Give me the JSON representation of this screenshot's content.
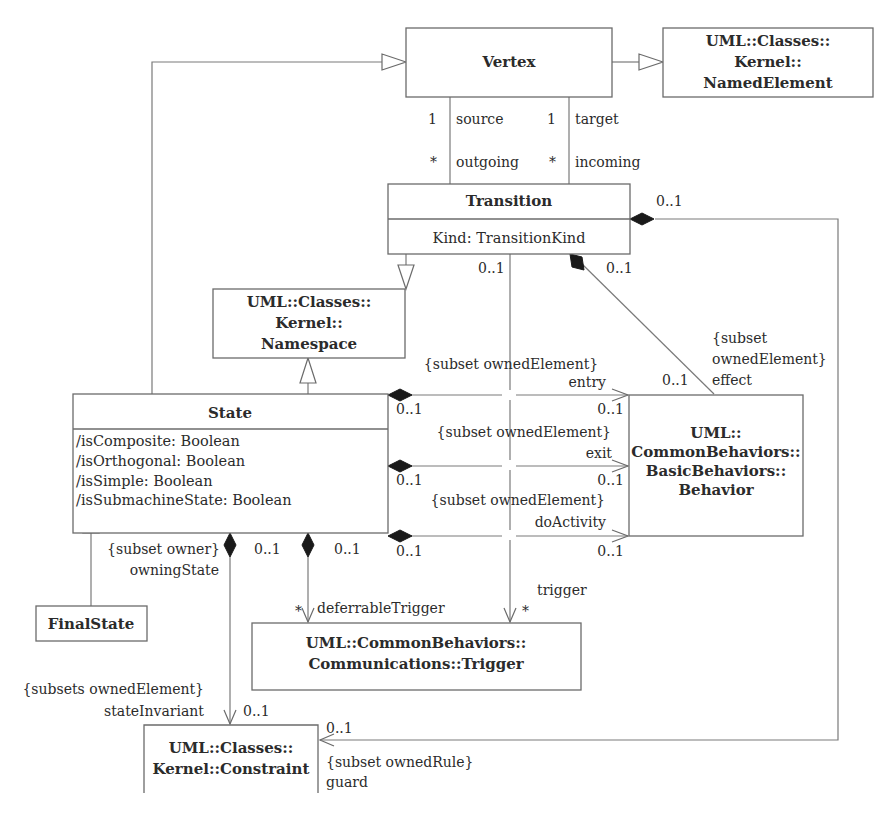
{
  "diagram": {
    "type": "UML class diagram",
    "classes": {
      "vertex": {
        "name": "Vertex"
      },
      "named_element": {
        "lines": [
          "UML::Classes::",
          "Kernel::",
          "NamedElement"
        ]
      },
      "transition": {
        "name": "Transition",
        "attributes": [
          "Kind: TransitionKind"
        ]
      },
      "namespace": {
        "lines": [
          "UML::Classes::",
          "Kernel::",
          "Namespace"
        ]
      },
      "state": {
        "name": "State",
        "attributes": [
          "/isComposite: Boolean",
          "/isOrthogonal: Boolean",
          "/isSimple: Boolean",
          "/isSubmachineState: Boolean"
        ]
      },
      "behavior": {
        "lines": [
          "UML::",
          "CommonBehaviors::",
          "BasicBehaviors::",
          "Behavior"
        ]
      },
      "final_state": {
        "name": "FinalState"
      },
      "trigger": {
        "lines": [
          "UML::CommonBehaviors::",
          "Communications::Trigger"
        ]
      },
      "constraint": {
        "lines": [
          "UML::Classes::",
          "Kernel::Constraint"
        ]
      }
    },
    "associations": {
      "source": {
        "mult_vertex": "1",
        "role_vertex": "source",
        "mult_transition": "*",
        "role_transition": "outgoing"
      },
      "target": {
        "mult_vertex": "1",
        "role_vertex": "target",
        "mult_transition": "*",
        "role_transition": "incoming"
      },
      "guard": {
        "mult_owner": "0..1",
        "mult_end": "0..1",
        "constraint": "{subset ownedRule}",
        "role": "guard"
      },
      "trigger": {
        "mult_owner": "0..1",
        "constraint": "{subset ownedElement}",
        "role": "trigger",
        "mult_end": "*"
      },
      "effect": {
        "mult_owner": "0..1",
        "constraint_line1": "{subset",
        "constraint_line2": "ownedElement}",
        "role": "effect",
        "mult_end": "0..1"
      },
      "entry": {
        "mult_owner": "0..1",
        "role": "entry",
        "mult_end": "0..1"
      },
      "exit": {
        "constraint": "{subset ownedElement}",
        "mult_owner": "0..1",
        "role": "exit",
        "mult_end": "0..1"
      },
      "do_activity": {
        "constraint": "{subset ownedElement}",
        "mult_owner": "0..1",
        "role": "doActivity",
        "mult_end": "0..1"
      },
      "state_invariant": {
        "owner_constraint": "{subset owner}",
        "owner_role": "owningState",
        "mult_owner": "0..1",
        "constraint": "{subsets ownedElement}",
        "role": "stateInvariant",
        "mult_end": "0..1"
      },
      "deferrable_trigger": {
        "mult_owner": "0..1",
        "mult_end": "*",
        "role": "deferrableTrigger"
      }
    }
  }
}
